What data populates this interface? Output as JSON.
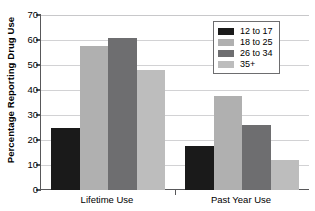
{
  "chart_data": {
    "type": "bar",
    "title": "",
    "xlabel": "",
    "ylabel": "Percentage Reporting Drug Use",
    "ylim": [
      0,
      70
    ],
    "ytick_step": 10,
    "yticks": [
      "70",
      "60",
      "50",
      "40",
      "30",
      "20",
      "10",
      "0"
    ],
    "grid": "horizontal",
    "legend_position": "top-right",
    "categories": [
      "Lifetime Use",
      "Past Year Use"
    ],
    "series": [
      {
        "name": "12 to 17",
        "color": "#1a1a1a",
        "values": [
          25,
          17.8
        ]
      },
      {
        "name": "18 to 25",
        "color": "#b0b0b0",
        "values": [
          57.5,
          37.8
        ]
      },
      {
        "name": "26 to 34",
        "color": "#6e6e70",
        "values": [
          61,
          26
        ]
      },
      {
        "name": "35+",
        "color": "#bdbdbd",
        "values": [
          48,
          12
        ]
      }
    ]
  },
  "legend": {
    "items": [
      {
        "label": "12 to 17"
      },
      {
        "label": "18 to 25"
      },
      {
        "label": "26 to 34"
      },
      {
        "label": "35+"
      }
    ]
  },
  "axes": {
    "y_title": "Percentage Reporting Drug Use",
    "y_ticks": [
      "70",
      "60",
      "50",
      "40",
      "30",
      "20",
      "10",
      "0"
    ],
    "x_ticks": [
      "Lifetime Use",
      "Past Year Use"
    ]
  }
}
